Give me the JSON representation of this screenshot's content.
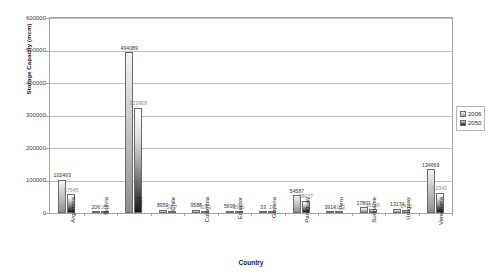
{
  "chart_data": {
    "type": "bar",
    "title": "",
    "xlabel": "Country",
    "ylabel": "Storage Capacity (mcm)",
    "ylim": [
      0,
      600000
    ],
    "ytick_labels": [
      "0",
      "100000",
      "200000",
      "300000",
      "400000",
      "500000",
      "600000"
    ],
    "ytick_values": [
      0,
      100000,
      200000,
      300000,
      400000,
      500000,
      600000
    ],
    "grid": true,
    "legend_position": "right",
    "categories": [
      "Argentina",
      "Bolivia",
      "Brazil",
      "Chile",
      "Colombia",
      "Ecuador",
      "Guyana",
      "Paraguay",
      "Peru",
      "Suriname",
      "Uruguay",
      "Venezuela"
    ],
    "series": [
      {
        "name": "2006",
        "color": "#c8c8c8",
        "values": [
          102493,
          206,
          494089,
          8959,
          9588,
          5699,
          33,
          54587,
          3914,
          17801,
          13174,
          134669
        ],
        "labels": [
          "102493",
          "206",
          "494089",
          "8959",
          "9588",
          "5699",
          "33",
          "54587",
          "3914",
          "17801",
          "13174",
          "134669"
        ]
      },
      {
        "name": "2050",
        "color": "#1a1a1a",
        "values": [
          57645,
          103,
          323969,
          5397,
          3053,
          2956,
          20,
          38037,
          2153,
          11148,
          8470,
          62343
        ],
        "labels": [
          "57645",
          "103",
          "323969",
          "5397",
          "3053",
          "2956",
          "20",
          "38037",
          "2153",
          "11148",
          "8470",
          "62343"
        ]
      }
    ]
  },
  "legend": {
    "entries": [
      {
        "label": "2006"
      },
      {
        "label": "2050"
      }
    ]
  }
}
